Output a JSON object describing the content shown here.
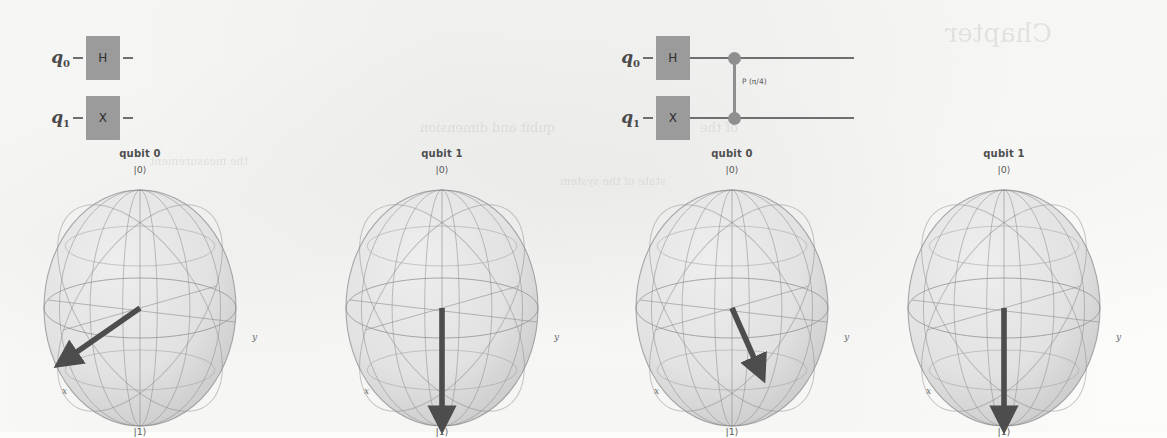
{
  "figure": {
    "kind": "quantum-circuit-and-bloch-spheres",
    "background_color": "#fdfdfc",
    "ink_color": "#4a4a4a",
    "gate_fill": "#9b9b9b",
    "wire_color": "#6f6f6f",
    "sphere_fill": "#e2e2e2",
    "sphere_line": "#8e8e8e",
    "arrow_color": "#4d4d4d"
  },
  "circuits": [
    {
      "id": "circuit-left",
      "rows": [
        {
          "label": "q",
          "sub": "0",
          "gate": "H"
        },
        {
          "label": "q",
          "sub": "1",
          "gate": "X"
        }
      ],
      "two_qubit_gate": null
    },
    {
      "id": "circuit-right",
      "rows": [
        {
          "label": "q",
          "sub": "0",
          "gate": "H"
        },
        {
          "label": "q",
          "sub": "1",
          "gate": "X"
        }
      ],
      "two_qubit_gate": {
        "label": "P (π/4)",
        "type": "controlled-phase"
      }
    }
  ],
  "bloch_spheres": [
    {
      "id": "bloch-1",
      "title": "qubit 0",
      "ket_top": "|0⟩",
      "ket_bottom": "|1⟩",
      "axis_x": "x",
      "axis_y": "y",
      "arrow": {
        "theta_deg": 90,
        "phi_deg": 0,
        "screen_angle_deg": 240,
        "length": 0.92,
        "description": "points toward +x (lower-left)"
      }
    },
    {
      "id": "bloch-2",
      "title": "qubit 1",
      "ket_top": "|0⟩",
      "ket_bottom": "|1⟩",
      "axis_x": "x",
      "axis_y": "y",
      "arrow": {
        "theta_deg": 180,
        "phi_deg": 0,
        "screen_angle_deg": 180,
        "length": 1.0,
        "description": "points straight down to |1⟩"
      }
    },
    {
      "id": "bloch-3",
      "title": "qubit 0",
      "ket_top": "|0⟩",
      "ket_bottom": "|1⟩",
      "axis_x": "x",
      "axis_y": "y",
      "arrow": {
        "theta_deg": 90,
        "phi_deg": 45,
        "screen_angle_deg": 152,
        "length": 0.62,
        "description": "rotated toward +y by π/4 phase (lower-right)"
      }
    },
    {
      "id": "bloch-4",
      "title": "qubit 1",
      "ket_top": "|0⟩",
      "ket_bottom": "|1⟩",
      "axis_x": "x",
      "axis_y": "y",
      "arrow": {
        "theta_deg": 180,
        "phi_deg": 0,
        "screen_angle_deg": 180,
        "length": 1.0,
        "description": "points straight down to |1⟩"
      }
    }
  ],
  "bleed_through": [
    {
      "text": "Chapter",
      "x": 945,
      "y": 18,
      "size": 26
    },
    {
      "text": "qubit and dimension",
      "x": 420,
      "y": 120,
      "size": 13
    },
    {
      "text": "of the",
      "x": 700,
      "y": 120,
      "size": 13
    },
    {
      "text": "the measurement",
      "x": 150,
      "y": 155,
      "size": 11
    },
    {
      "text": "state of the system",
      "x": 560,
      "y": 175,
      "size": 11
    }
  ]
}
